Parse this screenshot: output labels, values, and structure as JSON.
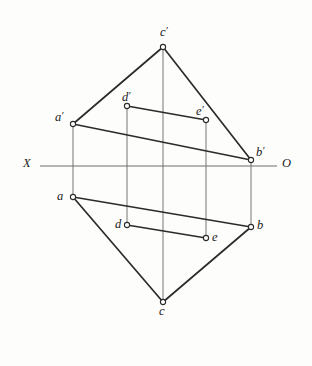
{
  "figure": {
    "background_color": "#fdfdfc",
    "line_color": "#2b2b2b",
    "axis_color": "#6e6e6e",
    "vertex_marker_fill": "#ffffff",
    "ground_line": {
      "left_label": "X",
      "right_label": "O",
      "y": 166,
      "x_start": 40,
      "x_end": 277
    },
    "labels": [
      {
        "key": "c_prime",
        "text": "c",
        "prime": true,
        "x": 160,
        "y": 25
      },
      {
        "key": "d_prime",
        "text": "d",
        "prime": true,
        "x": 122,
        "y": 90
      },
      {
        "key": "e_prime",
        "text": "e",
        "prime": true,
        "x": 196,
        "y": 104
      },
      {
        "key": "a_prime",
        "text": "a",
        "prime": true,
        "x": 55,
        "y": 110
      },
      {
        "key": "b_prime",
        "text": "b",
        "prime": true,
        "x": 256,
        "y": 145
      },
      {
        "key": "x_axis",
        "text": "X",
        "prime": false,
        "x": 23,
        "y": 157
      },
      {
        "key": "o_axis",
        "text": "O",
        "prime": false,
        "x": 282,
        "y": 157
      },
      {
        "key": "a",
        "text": "a",
        "prime": false,
        "x": 57,
        "y": 190
      },
      {
        "key": "d",
        "text": "d",
        "prime": false,
        "x": 115,
        "y": 218
      },
      {
        "key": "e",
        "text": "e",
        "prime": false,
        "x": 212,
        "y": 231
      },
      {
        "key": "b",
        "text": "b",
        "prime": false,
        "x": 257,
        "y": 219
      },
      {
        "key": "c",
        "text": "c",
        "prime": false,
        "x": 159,
        "y": 305
      }
    ],
    "points": [
      {
        "key": "c_prime",
        "x": 163,
        "y": 47,
        "r": 2.6
      },
      {
        "key": "d_prime",
        "x": 127,
        "y": 106,
        "r": 2.6
      },
      {
        "key": "e_prime",
        "x": 206,
        "y": 120,
        "r": 2.6
      },
      {
        "key": "a_prime",
        "x": 73,
        "y": 124,
        "r": 2.6
      },
      {
        "key": "b_prime",
        "x": 251,
        "y": 160,
        "r": 2.6
      },
      {
        "key": "a",
        "x": 73,
        "y": 197,
        "r": 2.6
      },
      {
        "key": "d",
        "x": 127,
        "y": 225,
        "r": 2.6
      },
      {
        "key": "b",
        "x": 251,
        "y": 227,
        "r": 2.6
      },
      {
        "key": "e",
        "x": 206,
        "y": 238,
        "r": 2.6
      },
      {
        "key": "c",
        "x": 163,
        "y": 302,
        "r": 2.6
      }
    ],
    "edges": [
      {
        "key": "a_prime-c_prime",
        "x1": 73,
        "y1": 124,
        "x2": 163,
        "y2": 47
      },
      {
        "key": "c_prime-b_prime",
        "x1": 163,
        "y1": 47,
        "x2": 251,
        "y2": 160
      },
      {
        "key": "a_prime-b_prime",
        "x1": 73,
        "y1": 124,
        "x2": 251,
        "y2": 160
      },
      {
        "key": "d_prime-e_prime",
        "x1": 127,
        "y1": 106,
        "x2": 206,
        "y2": 120
      },
      {
        "key": "a-b",
        "x1": 73,
        "y1": 197,
        "x2": 251,
        "y2": 227
      },
      {
        "key": "a-c",
        "x1": 73,
        "y1": 197,
        "x2": 163,
        "y2": 302
      },
      {
        "key": "c-b",
        "x1": 163,
        "y1": 302,
        "x2": 251,
        "y2": 227
      },
      {
        "key": "d-e",
        "x1": 127,
        "y1": 225,
        "x2": 206,
        "y2": 238
      }
    ],
    "projection_lines": [
      {
        "key": "a_prime-a",
        "x": 73,
        "y1": 124,
        "y2": 197
      },
      {
        "key": "b_prime-b",
        "x": 251,
        "y1": 160,
        "y2": 227
      },
      {
        "key": "c_prime-c",
        "x": 163,
        "y1": 47,
        "y2": 302
      },
      {
        "key": "d_prime-d",
        "x": 127,
        "y1": 106,
        "y2": 225
      },
      {
        "key": "e_prime-e",
        "x": 206,
        "y1": 120,
        "y2": 238
      }
    ]
  }
}
